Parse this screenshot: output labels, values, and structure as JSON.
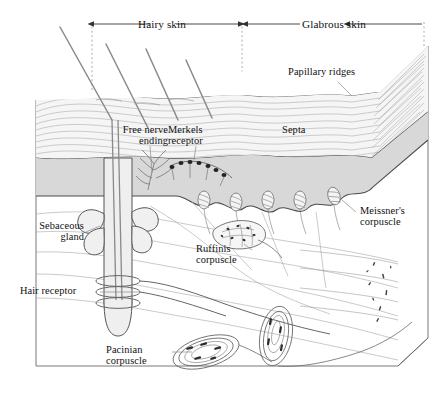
{
  "figure": {
    "width": 434,
    "height": 405,
    "background_color": "#ffffff"
  },
  "colors": {
    "ink": "#111111",
    "line": "#555555",
    "hairline": "#888888",
    "epidermis_fill": "#f2f2f2",
    "dermis_fill": "#d9d9d9",
    "block_fill": "#fbfbfb",
    "guide_dash": "#9a9a9a",
    "corpuscle_stroke": "#6f6f6f"
  },
  "band_labels": [
    {
      "id": "hairy-skin",
      "text": "Hairy skin",
      "left": 108,
      "top": 18,
      "width": 108,
      "arrow_left_x": 92,
      "arrow_right_x": 238,
      "arrow_y": 24
    },
    {
      "id": "glabrous-skin",
      "text": "Glabrous skin",
      "left": 278,
      "top": 18,
      "width": 112,
      "arrow_left_x": 246,
      "arrow_right_x": 424,
      "arrow_y": 24
    }
  ],
  "part_labels": [
    {
      "id": "papillary-ridges",
      "text": "Papillary ridges",
      "left": 288,
      "top": 66,
      "width": 104,
      "align": "left"
    },
    {
      "id": "free-nerve-ending",
      "text": "Free nerve\nending",
      "left": 94,
      "top": 124,
      "width": 74,
      "align": "right"
    },
    {
      "id": "merkels-receptor",
      "text": "Merkels\nreceptor",
      "left": 168,
      "top": 124,
      "width": 62,
      "align": "left"
    },
    {
      "id": "septa",
      "text": "Septa",
      "left": 282,
      "top": 124,
      "width": 46,
      "align": "left"
    },
    {
      "id": "sebaceous-gland",
      "text": "Sebaceous\ngland",
      "left": 8,
      "top": 220,
      "width": 76,
      "align": "right"
    },
    {
      "id": "hair-receptor",
      "text": "Hair receptor",
      "left": 20,
      "top": 285,
      "width": 80,
      "align": "left"
    },
    {
      "id": "ruffinis-corpuscle",
      "text": "Ruffinis\ncorpuscle",
      "left": 196,
      "top": 243,
      "width": 66,
      "align": "left"
    },
    {
      "id": "meissners-corpuscle",
      "text": "Meissner's\ncorpuscle",
      "left": 360,
      "top": 205,
      "width": 72,
      "align": "left"
    },
    {
      "id": "pacinian-corpuscle",
      "text": "Pacinian\ncorpuscle",
      "left": 106,
      "top": 344,
      "width": 66,
      "align": "left"
    }
  ],
  "structures": {
    "hair_shaft_count": 4,
    "meissner_corpuscle_count": 5,
    "papillary_ridge_count": 5,
    "hair_receptor_coil_count": 3,
    "pacinian_corpuscle_count": 2,
    "epidermis_layer_line_count": 9
  }
}
